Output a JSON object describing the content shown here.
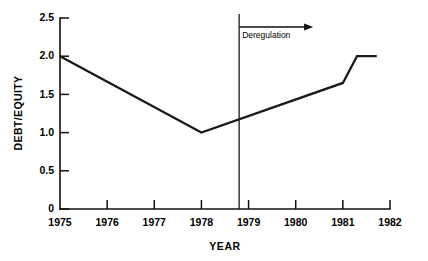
{
  "chart_data": {
    "type": "line",
    "title": "",
    "xlabel": "YEAR",
    "ylabel": "DEBT/EQUITY",
    "xlim": [
      1975,
      1982
    ],
    "ylim": [
      0,
      2.5
    ],
    "grid": false,
    "legend": "none",
    "x_ticks": [
      "1975",
      "1976",
      "1977",
      "1978",
      "1979",
      "1980",
      "1981",
      "1982"
    ],
    "x_tick_values": [
      1975,
      1976,
      1977,
      1978,
      1979,
      1980,
      1981,
      1982
    ],
    "y_ticks": [
      "0",
      "0.5",
      "1.0",
      "1.5",
      "2.0",
      "2.5"
    ],
    "y_tick_values": [
      0,
      0.5,
      1.0,
      1.5,
      2.0,
      2.5
    ],
    "series": [
      {
        "name": "Debt/Equity",
        "x": [
          1975,
          1978,
          1981,
          1981.3,
          1981.72
        ],
        "values": [
          2.0,
          1.0,
          1.65,
          2.0,
          2.0
        ]
      }
    ],
    "annotations": [
      {
        "name": "deregulation-marker",
        "label": "Deregulation",
        "x": 1978.8,
        "kind": "vertical-line-with-right-arrow",
        "arrow_direction": "right"
      }
    ],
    "colors": {
      "line": "#1a1a1a",
      "axis": "#111111",
      "background": "#ffffff",
      "text": "#000000"
    }
  }
}
